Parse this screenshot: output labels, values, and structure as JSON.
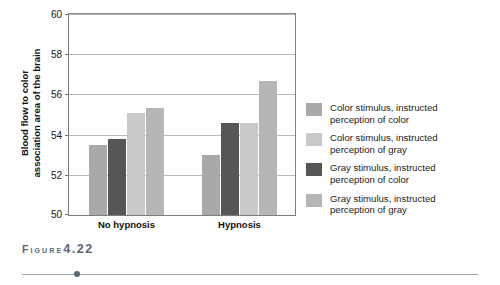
{
  "figure": {
    "caption_word": "Figure",
    "caption_number": "4.22"
  },
  "chart_data": {
    "type": "bar",
    "title": "",
    "xlabel": "",
    "ylabel": "Blood flow to color association area of the brain",
    "ylabel_line1": "Blood flow to color",
    "ylabel_line2": "association area of the brain",
    "ylim": [
      50,
      60
    ],
    "yticks": [
      50,
      52,
      54,
      56,
      58,
      60
    ],
    "ytick_labels": [
      "50",
      "52",
      "54",
      "56",
      "58",
      "60"
    ],
    "grid": true,
    "legend_position": "right",
    "categories": [
      "No hypnosis",
      "Hypnosis"
    ],
    "series": [
      {
        "name": "Color stimulus, instructed perception of color",
        "name_line1": "Color stimulus, instructed",
        "name_line2": "perception of color",
        "color": "#a9a9a9",
        "values": [
          53.5,
          53.0
        ]
      },
      {
        "name": "Color stimulus, instructed perception of gray",
        "name_line1": "Color stimulus, instructed",
        "name_line2": "perception of gray",
        "color": "#c9c9c9",
        "values": [
          53.8,
          54.6
        ]
      },
      {
        "name": "Gray stimulus, instructed perception of color",
        "name_line1": "Gray stimulus, instructed",
        "name_line2": "perception of color",
        "color": "#565656",
        "values": [
          55.1,
          54.6
        ]
      },
      {
        "name": "Gray stimulus, instructed perception of gray",
        "name_line1": "Gray stimulus, instructed",
        "name_line2": "perception of gray",
        "color": "#b6b6b6",
        "values": [
          55.3,
          56.65
        ]
      }
    ],
    "bar_draw_order": [
      {
        "group": 0,
        "series": 0,
        "value": 53.5,
        "color": "#a9a9a9"
      },
      {
        "group": 0,
        "series": 2,
        "value": 53.8,
        "color": "#565656"
      },
      {
        "group": 0,
        "series": 1,
        "value": 55.1,
        "color": "#c9c9c9"
      },
      {
        "group": 0,
        "series": 3,
        "value": 55.3,
        "color": "#b6b6b6"
      },
      {
        "group": 1,
        "series": 0,
        "value": 53.0,
        "color": "#a9a9a9"
      },
      {
        "group": 1,
        "series": 2,
        "value": 54.6,
        "color": "#565656"
      },
      {
        "group": 1,
        "series": 1,
        "value": 54.6,
        "color": "#c9c9c9"
      },
      {
        "group": 1,
        "series": 3,
        "value": 56.65,
        "color": "#b6b6b6"
      }
    ]
  }
}
